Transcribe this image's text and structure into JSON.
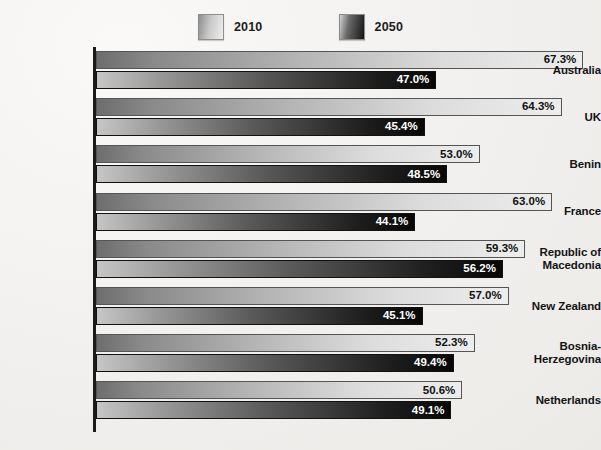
{
  "chart_data": {
    "type": "bar",
    "orientation": "horizontal",
    "title": "",
    "xlabel": "",
    "ylabel": "",
    "grid": false,
    "legend_position": "top-center",
    "xlim": [
      0,
      70
    ],
    "value_suffix": "%",
    "categories": [
      "Australia",
      "UK",
      "Benin",
      "France",
      "Republic of\nMacedonia",
      "New Zealand",
      "Bosnia-\nHerzegovina",
      "Netherlands"
    ],
    "series": [
      {
        "name": "2010",
        "color": "#c9c9c9",
        "values": [
          67.3,
          64.3,
          53.0,
          63.0,
          59.3,
          57.0,
          52.3,
          50.6
        ],
        "labels": [
          "67.3%",
          "64.3%",
          "53.0%",
          "63.0%",
          "59.3%",
          "57.0%",
          "52.3%",
          "50.6%"
        ]
      },
      {
        "name": "2050",
        "color": "#1e1e1e",
        "values": [
          47.0,
          45.4,
          48.5,
          44.1,
          56.2,
          45.1,
          49.4,
          49.1
        ],
        "labels": [
          "47.0%",
          "45.4%",
          "48.5%",
          "44.1%",
          "56.2%",
          "45.1%",
          "49.4%",
          "49.1%"
        ]
      }
    ]
  },
  "legend": {
    "items": [
      {
        "label": "2010",
        "swatch": "light-gradient-swatch"
      },
      {
        "label": "2050",
        "swatch": "dark-gradient-swatch"
      }
    ]
  },
  "rows": [
    {
      "category": "Australia",
      "line1": "Australia",
      "line2": "",
      "v2010": "67.3%",
      "v2050": "47.0%"
    },
    {
      "category": "UK",
      "line1": "UK",
      "line2": "",
      "v2010": "64.3%",
      "v2050": "45.4%"
    },
    {
      "category": "Benin",
      "line1": "Benin",
      "line2": "",
      "v2010": "53.0%",
      "v2050": "48.5%"
    },
    {
      "category": "France",
      "line1": "France",
      "line2": "",
      "v2010": "63.0%",
      "v2050": "44.1%"
    },
    {
      "category": "Republic of Macedonia",
      "line1": "Republic of",
      "line2": "Macedonia",
      "v2010": "59.3%",
      "v2050": "56.2%"
    },
    {
      "category": "New Zealand",
      "line1": "New Zealand",
      "line2": "",
      "v2010": "57.0%",
      "v2050": "45.1%"
    },
    {
      "category": "Bosnia-Herzegovina",
      "line1": "Bosnia-",
      "line2": "Herzegovina",
      "v2010": "52.3%",
      "v2050": "49.4%"
    },
    {
      "category": "Netherlands",
      "line1": "Netherlands",
      "line2": "",
      "v2010": "50.6%",
      "v2050": "49.1%"
    }
  ]
}
